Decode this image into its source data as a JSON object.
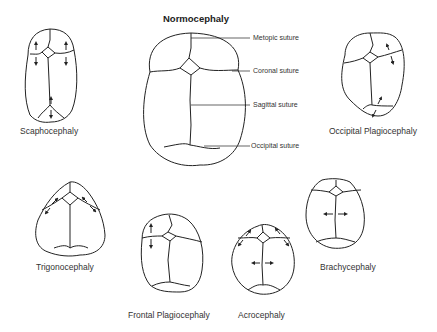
{
  "title": "Normocephaly",
  "annotations": [
    {
      "label": "Metopic suture"
    },
    {
      "label": "Coronal suture"
    },
    {
      "label": "Sagittal suture"
    },
    {
      "label": "Occipital suture"
    }
  ],
  "skulls": [
    {
      "id": "scaphocephaly",
      "label": "Scaphocephaly"
    },
    {
      "id": "occipital-plagiocephaly",
      "label": "Occipital Plagiocephaly"
    },
    {
      "id": "trigonocephaly",
      "label": "Trigonocephaly"
    },
    {
      "id": "frontal-plagiocephaly",
      "label": "Frontal Plagiocephaly"
    },
    {
      "id": "acrocephaly",
      "label": "Acrocephaly"
    },
    {
      "id": "brachycephaly",
      "label": "Brachycephaly"
    }
  ],
  "colors": {
    "stroke": "#222222",
    "background": "#ffffff"
  }
}
